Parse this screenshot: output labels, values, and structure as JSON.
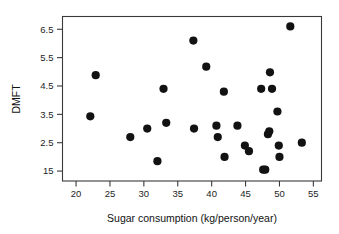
{
  "chart_data": {
    "type": "scatter",
    "title": "",
    "xlabel": "Sugar consumption (kg/person/year)",
    "ylabel": "DMFT",
    "xlim": [
      18.0,
      56.2
    ],
    "ylim": [
      1.15,
      6.95
    ],
    "xticks": [
      20,
      25,
      30,
      35,
      40,
      45,
      50,
      55
    ],
    "xticklabels": [
      "20",
      "25",
      "30",
      "35",
      "40",
      "45",
      "50",
      "55"
    ],
    "yticks": [
      1.5,
      2.5,
      3.5,
      4.5,
      5.5,
      6.5
    ],
    "yticklabels": [
      "15",
      "2.5",
      "3.5",
      "4.5",
      "5.5",
      "6.5"
    ],
    "grid": false,
    "legend": null,
    "marker": "filled-circle",
    "marker_color": "#121212",
    "marker_size": 4.1,
    "points": [
      {
        "x": 22.1,
        "y": 3.43
      },
      {
        "x": 22.9,
        "y": 4.88
      },
      {
        "x": 28.0,
        "y": 2.7
      },
      {
        "x": 30.5,
        "y": 3.0
      },
      {
        "x": 32.0,
        "y": 1.85
      },
      {
        "x": 32.9,
        "y": 4.4
      },
      {
        "x": 33.3,
        "y": 3.2
      },
      {
        "x": 37.3,
        "y": 6.1
      },
      {
        "x": 37.4,
        "y": 3.0
      },
      {
        "x": 39.2,
        "y": 5.18
      },
      {
        "x": 40.7,
        "y": 3.1
      },
      {
        "x": 40.9,
        "y": 2.7
      },
      {
        "x": 41.8,
        "y": 4.3
      },
      {
        "x": 41.9,
        "y": 2.0
      },
      {
        "x": 43.8,
        "y": 3.1
      },
      {
        "x": 44.9,
        "y": 2.4
      },
      {
        "x": 45.5,
        "y": 2.2
      },
      {
        "x": 47.3,
        "y": 4.4
      },
      {
        "x": 47.6,
        "y": 1.55
      },
      {
        "x": 47.9,
        "y": 1.55
      },
      {
        "x": 48.3,
        "y": 2.8
      },
      {
        "x": 48.5,
        "y": 2.9
      },
      {
        "x": 48.6,
        "y": 4.98
      },
      {
        "x": 48.9,
        "y": 4.4
      },
      {
        "x": 49.7,
        "y": 3.6
      },
      {
        "x": 49.9,
        "y": 2.4
      },
      {
        "x": 50.0,
        "y": 2.0
      },
      {
        "x": 51.6,
        "y": 6.6
      },
      {
        "x": 53.3,
        "y": 2.5
      }
    ]
  }
}
